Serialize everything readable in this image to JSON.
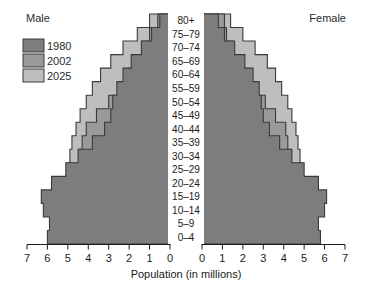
{
  "header": {
    "male_label": "Male",
    "female_label": "Female"
  },
  "legend": {
    "items": [
      {
        "label": "1980",
        "color": "#7d7d7d"
      },
      {
        "label": "2002",
        "color": "#9a9a9a"
      },
      {
        "label": "2025",
        "color": "#bebebe"
      }
    ]
  },
  "axis": {
    "title": "Population (in millions)",
    "left_ticks": [
      "7",
      "6",
      "5",
      "4",
      "3",
      "2",
      "1",
      "0"
    ],
    "right_ticks": [
      "0",
      "1",
      "2",
      "3",
      "4",
      "5",
      "6",
      "7"
    ],
    "max": 7,
    "min": 0
  },
  "chart_data": {
    "type": "bar",
    "subtype": "population-pyramid",
    "title": "",
    "xlabel": "Population (in millions)",
    "ylabel": "",
    "xlim": [
      0,
      7
    ],
    "grid": false,
    "legend_position": "top-left",
    "orientation": "horizontal-diverging",
    "categories": [
      "0–4",
      "5–9",
      "10–14",
      "15–19",
      "20–24",
      "25–29",
      "30–34",
      "35–39",
      "40–44",
      "45–49",
      "50–54",
      "55–59",
      "60–64",
      "65–69",
      "70–74",
      "75–79",
      "80+"
    ],
    "series": [
      {
        "name": "1980",
        "side": "male",
        "color": "#7d7d7d",
        "values": [
          6.0,
          5.9,
          6.2,
          6.3,
          5.8,
          5.1,
          4.5,
          3.8,
          3.2,
          2.9,
          2.8,
          2.6,
          2.3,
          1.9,
          1.4,
          0.9,
          0.5
        ]
      },
      {
        "name": "2002",
        "side": "male",
        "color": "#9a9a9a",
        "values": [
          5.6,
          5.4,
          5.3,
          5.0,
          4.7,
          4.5,
          4.4,
          4.3,
          4.1,
          3.6,
          3.0,
          2.5,
          2.0,
          1.6,
          1.3,
          1.0,
          0.6
        ]
      },
      {
        "name": "2025",
        "side": "male",
        "color": "#bebebe",
        "values": [
          5.5,
          5.4,
          5.3,
          5.2,
          5.1,
          5.0,
          4.9,
          4.8,
          4.6,
          4.4,
          4.1,
          3.8,
          3.4,
          2.9,
          2.3,
          1.6,
          1.0
        ]
      },
      {
        "name": "1980",
        "side": "female",
        "color": "#7d7d7d",
        "values": [
          5.8,
          5.7,
          6.0,
          6.1,
          5.7,
          5.0,
          4.4,
          3.8,
          3.3,
          3.0,
          2.9,
          2.8,
          2.5,
          2.1,
          1.6,
          1.1,
          0.8
        ]
      },
      {
        "name": "2002",
        "side": "female",
        "color": "#9a9a9a",
        "values": [
          5.4,
          5.2,
          5.1,
          4.8,
          4.6,
          4.4,
          4.3,
          4.2,
          4.1,
          3.6,
          3.1,
          2.6,
          2.1,
          1.8,
          1.5,
          1.2,
          1.1
        ],
        "note": ""
      },
      {
        "name": "2025",
        "side": "female",
        "color": "#bebebe",
        "values": [
          5.3,
          5.2,
          5.1,
          5.0,
          4.9,
          4.9,
          4.8,
          4.7,
          4.6,
          4.4,
          4.2,
          3.9,
          3.6,
          3.2,
          2.6,
          2.0,
          1.4
        ]
      }
    ]
  }
}
